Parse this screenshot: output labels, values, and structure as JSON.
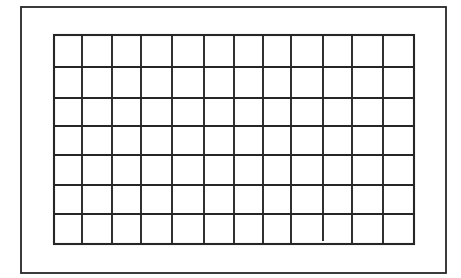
{
  "diagram": {
    "type": "grid",
    "colors": {
      "background": "#ffffff",
      "line": "#262626"
    },
    "outer_frame": {
      "x1": 21,
      "y1": 7,
      "x2": 446,
      "y2": 273
    },
    "grid": {
      "columns": 12,
      "rows": 7,
      "x_lines": [
        54,
        82,
        112,
        141,
        172,
        204,
        234,
        263,
        291,
        323,
        352,
        383,
        414
      ],
      "y_lines": [
        35,
        67,
        98,
        126,
        155,
        185,
        214,
        244
      ],
      "partial_lines": [
        {
          "axis": "vertical",
          "x": 323,
          "y_from": 35,
          "y_to": 240
        }
      ]
    }
  }
}
